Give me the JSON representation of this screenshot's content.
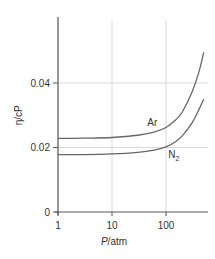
{
  "chart_data": {
    "type": "line",
    "title": "",
    "xlabel_italic": "P",
    "xlabel_rest": "/atm",
    "ylabel": "η/cP",
    "xscale": "log",
    "xlim": [
      1,
      500
    ],
    "ylim": [
      0,
      0.05
    ],
    "x_ticks": [
      1,
      10,
      100
    ],
    "x_tick_labels": [
      "1",
      "10",
      "100"
    ],
    "y_ticks": [
      0,
      0.02,
      0.04
    ],
    "y_tick_labels": [
      "0",
      "0.02",
      "0.04"
    ],
    "grid": true,
    "series": [
      {
        "name": "Ar",
        "label": "Ar",
        "x": [
          1,
          3,
          10,
          30,
          60,
          100,
          150,
          200,
          300,
          400,
          500
        ],
        "y": [
          0.0228,
          0.0229,
          0.0231,
          0.0238,
          0.0248,
          0.0262,
          0.0285,
          0.031,
          0.037,
          0.043,
          0.0495
        ]
      },
      {
        "name": "N2",
        "label": "N",
        "label_sub": "2",
        "x": [
          1,
          3,
          10,
          30,
          60,
          100,
          150,
          200,
          300,
          400,
          500
        ],
        "y": [
          0.0178,
          0.0178,
          0.018,
          0.0185,
          0.0192,
          0.0202,
          0.0218,
          0.0236,
          0.0275,
          0.0315,
          0.035
        ]
      }
    ],
    "colors": {
      "axis": "#555555",
      "grid": "#d8d8d8",
      "line": "#666666"
    }
  }
}
